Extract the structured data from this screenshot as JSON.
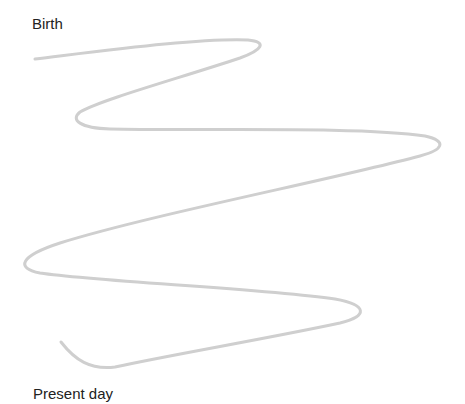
{
  "diagram": {
    "type": "timeline-lifeline",
    "start_label": "Birth",
    "end_label": "Present day",
    "line_color": "#cfcfcf",
    "line_width": 3,
    "path_points_approx": [
      [
        35,
        59
      ],
      [
        258,
        42
      ],
      [
        78,
        118
      ],
      [
        441,
        143
      ],
      [
        23,
        266
      ],
      [
        362,
        312
      ],
      [
        100,
        368
      ],
      [
        61,
        342
      ]
    ]
  }
}
